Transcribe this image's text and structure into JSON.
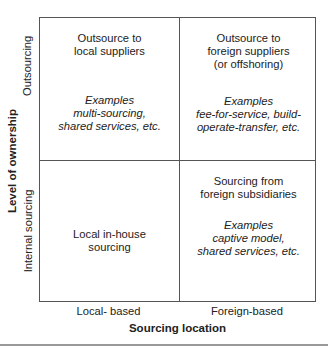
{
  "y_axis": {
    "title": "Level of ownership",
    "rows": [
      {
        "label": "Outsourcing"
      },
      {
        "label": "Internal sourcing"
      }
    ]
  },
  "x_axis": {
    "title": "Sourcing location",
    "columns": [
      {
        "label": "Local- based"
      },
      {
        "label": "Foreign-based"
      }
    ]
  },
  "quadrants": {
    "top_left": {
      "title": [
        "Outsource to",
        "local suppliers"
      ],
      "examples": [
        "Examples",
        "multi-sourcing,",
        "shared services, etc."
      ]
    },
    "top_right": {
      "title": [
        "Outsource to",
        "foreign suppliers",
        "(or offshoring)"
      ],
      "examples": [
        "Examples",
        "fee-for-service, build-",
        "operate-transfer, etc."
      ]
    },
    "bottom_left": {
      "title": [
        "Local in-house",
        "sourcing"
      ]
    },
    "bottom_right": {
      "title": [
        "Sourcing from",
        "foreign subsidiaries"
      ],
      "examples": [
        "Examples",
        "captive model,",
        "shared services, etc."
      ]
    }
  }
}
